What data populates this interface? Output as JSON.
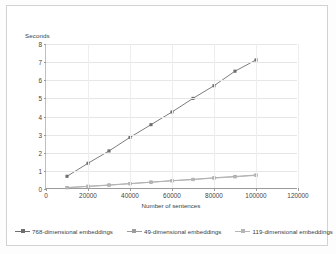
{
  "chart_data": {
    "type": "line",
    "title": "",
    "xlabel": "Number of sentences",
    "ylabel": "Seconds",
    "xlim": [
      0,
      120000
    ],
    "ylim": [
      0,
      8
    ],
    "xticks": [
      "0",
      "20000",
      "40000",
      "60000",
      "80000",
      "100000",
      "120000"
    ],
    "xtick_values": [
      0,
      20000,
      40000,
      60000,
      80000,
      100000,
      120000
    ],
    "yticks": [
      "0",
      "1",
      "2",
      "3",
      "4",
      "5",
      "6",
      "7",
      "8"
    ],
    "ytick_values": [
      0,
      1,
      2,
      3,
      4,
      5,
      6,
      7,
      8
    ],
    "grid": "horizontal-and-vertical",
    "legend_position": "bottom",
    "x": [
      10000,
      20000,
      30000,
      40000,
      50000,
      60000,
      70000,
      80000,
      90000,
      100000
    ],
    "series": [
      {
        "name": "768-dimensional embeddings",
        "color": "#6e6e6e",
        "marker": "square",
        "values": [
          0.7,
          1.42,
          2.1,
          2.85,
          3.55,
          4.25,
          5.0,
          5.7,
          6.5,
          7.12
        ]
      },
      {
        "name": "49-dimensional embeddings",
        "color": "#9c9c9c",
        "marker": "square",
        "values": [
          0.08,
          0.15,
          0.22,
          0.3,
          0.38,
          0.46,
          0.53,
          0.62,
          0.69,
          0.77
        ]
      },
      {
        "name": "119-dimensional embeddings",
        "color": "#b5b5b5",
        "marker": "square",
        "values": [
          0.07,
          0.14,
          0.21,
          0.29,
          0.37,
          0.45,
          0.52,
          0.6,
          0.67,
          0.75
        ]
      }
    ]
  },
  "legend": {
    "entries": [
      {
        "label": "768-dimensional embeddings"
      },
      {
        "label": "49-dimensional embeddings"
      },
      {
        "label": "119-dimensional embeddings"
      }
    ]
  },
  "colors": {
    "frame": "#d2d2d2",
    "grid": "#e6e6e6",
    "axis": "#9a9a9a",
    "text": "#3b3b3b"
  }
}
